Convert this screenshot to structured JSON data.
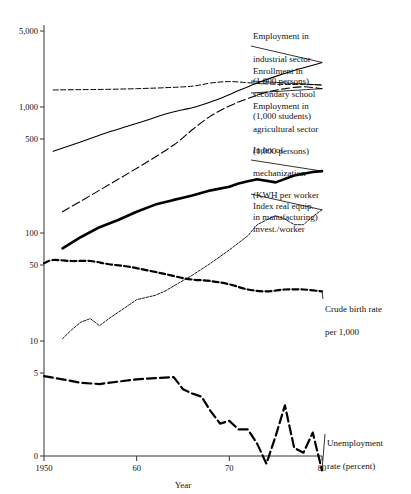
{
  "chart_data": {
    "type": "line",
    "title": "",
    "xlabel": "Year",
    "ylabel": "",
    "scale": "log",
    "grid": false,
    "legend_position": "right-inline-annotations",
    "xlim": [
      1950,
      1980
    ],
    "ylim": [
      0,
      5000
    ],
    "x_ticks": [
      {
        "value": 1950,
        "label": "1950"
      },
      {
        "value": 1960,
        "label": "60"
      },
      {
        "value": 1970,
        "label": "70"
      },
      {
        "value": 1980,
        "label": "80"
      }
    ],
    "y_ticks": [
      {
        "value": 5000,
        "label": "5,000"
      },
      {
        "value": 1000,
        "label": "1,000"
      },
      {
        "value": 500,
        "label": "500"
      },
      {
        "value": 100,
        "label": "100"
      },
      {
        "value": 50,
        "label": "50"
      },
      {
        "value": 10,
        "label": "10"
      },
      {
        "value": 5,
        "label": "5"
      },
      {
        "value": 0,
        "label": "0"
      }
    ],
    "series": [
      {
        "name": "Employment in industrial sector (1,000 persons)",
        "label_lines": [
          "Employment in",
          "industrial sector",
          "(1,000 persons)"
        ],
        "style": "solid-thin",
        "x": [
          1951,
          1953,
          1955,
          1957,
          1959,
          1961,
          1963,
          1965,
          1966,
          1967,
          1969,
          1971,
          1973,
          1975,
          1977,
          1979,
          1980
        ],
        "values": [
          440,
          500,
          570,
          650,
          730,
          820,
          930,
          1020,
          1060,
          1120,
          1280,
          1500,
          1750,
          2000,
          2250,
          2500,
          2650
        ]
      },
      {
        "name": "Enrollment in secondary school (1,000 students)",
        "label_lines": [
          "Enrollment in",
          "secondary school",
          "(1,000 students)"
        ],
        "style": "dashed-fine",
        "x": [
          1951,
          1954,
          1957,
          1960,
          1963,
          1966,
          1968,
          1970,
          1972,
          1974,
          1976,
          1978,
          1980
        ],
        "values": [
          1520,
          1530,
          1540,
          1560,
          1590,
          1640,
          1750,
          1800,
          1760,
          1720,
          1700,
          1700,
          1680
        ]
      },
      {
        "name": "Employment in agricultural sector (1,000 persons)",
        "label_lines": [
          "Employment in",
          "agricultural sector",
          "(1,000 persons)"
        ],
        "style": "long-dash",
        "x": [
          1952,
          1955,
          1958,
          1961,
          1964,
          1966,
          1968,
          1970,
          1972,
          1974,
          1976,
          1978,
          1980
        ],
        "values": [
          130,
          180,
          250,
          350,
          500,
          680,
          900,
          1100,
          1280,
          1450,
          1560,
          1620,
          1560
        ]
      },
      {
        "name": "Index of mechanization (KWH per worker in manufacturing)",
        "label_lines": [
          "Index of",
          "mechanization",
          "(KWH per worker",
          "in manufacturing)"
        ],
        "style": "solid-thick",
        "x": [
          1952,
          1954,
          1956,
          1958,
          1960,
          1962,
          1964,
          1965,
          1966,
          1968,
          1970,
          1971,
          1972,
          1973,
          1975,
          1977,
          1979,
          1980
        ],
        "values": [
          62,
          78,
          95,
          110,
          130,
          150,
          165,
          172,
          180,
          200,
          215,
          230,
          240,
          250,
          235,
          270,
          290,
          295
        ]
      },
      {
        "name": "Index real equip. invest./worker",
        "label_lines": [
          "Index real equip.",
          "invest./worker"
        ],
        "style": "dotted-fine",
        "x": [
          1952,
          1953,
          1954,
          1955,
          1956,
          1957,
          1958,
          1960,
          1962,
          1963,
          1964,
          1966,
          1968,
          1970,
          1972,
          1973,
          1974,
          1975,
          1976,
          1977,
          1978,
          1979,
          1980
        ],
        "values": [
          10,
          12,
          14,
          15,
          13,
          15,
          17,
          22,
          24,
          26,
          29,
          36,
          46,
          60,
          80,
          100,
          110,
          120,
          112,
          100,
          100,
          118,
          135
        ]
      },
      {
        "name": "Crude birth rate per 1,000",
        "label_lines": [
          "Crude birth rate",
          "per 1,000"
        ],
        "style": "dashed-bold",
        "x": [
          1950,
          1951,
          1953,
          1955,
          1957,
          1959,
          1961,
          1963,
          1965,
          1966,
          1968,
          1970,
          1972,
          1974,
          1976,
          1978,
          1980
        ],
        "values": [
          46,
          49,
          48,
          48,
          45,
          43,
          40,
          37,
          34,
          33,
          32,
          30,
          27,
          26,
          27,
          27,
          26
        ]
      },
      {
        "name": "Unemployment rate (percent)",
        "label_lines": [
          "Unemployment",
          "rate (percent)"
        ],
        "style": "dashed-long-bold",
        "x": [
          1950,
          1952,
          1954,
          1956,
          1958,
          1960,
          1962,
          1964,
          1965,
          1966,
          1967,
          1968,
          1969,
          1970,
          1971,
          1972,
          1973,
          1974,
          1975,
          1976,
          1977,
          1978,
          1979,
          1980
        ],
        "values": [
          4.7,
          4.4,
          4.1,
          4.0,
          4.2,
          4.4,
          4.5,
          4.6,
          3.6,
          3.3,
          3.1,
          2.3,
          1.8,
          1.9,
          1.6,
          1.6,
          1.2,
          0.8,
          1.4,
          2.6,
          1.1,
          1.0,
          1.5,
          0.7
        ]
      }
    ],
    "annotations": [
      "Employment in industrial sector (1,000 persons)",
      "Enrollment in secondary school (1,000 students)",
      "Employment in agricultural sector (1,000 persons)",
      "Index of mechanization (KWH per worker in manufacturing)",
      "Index real equip. invest./worker",
      "Crude birth rate per 1,000",
      "Unemployment rate (percent)"
    ]
  },
  "labels": {
    "s1_l1": "Employment in",
    "s1_l2": "industrial sector",
    "s1_l3": "(1,000 persons)",
    "s2_l1": "Enrollment in",
    "s2_l2": "secondary school",
    "s2_l3": "(1,000 students)",
    "s3_l1": "Employment in",
    "s3_l2": "agricultural sector",
    "s3_l3": "(1,000 persons)",
    "s4_l1": "Index of",
    "s4_l2": "mechanization",
    "s4_l3": "(KWH per worker",
    "s4_l4": "in manufacturing)",
    "s5_l1": "Index real equip.",
    "s5_l2": "invest./worker",
    "s6_l1": "Crude birth rate",
    "s6_l2": "per 1,000",
    "s7_l1": "Unemployment",
    "s7_l2": "rate (percent)"
  },
  "colors": {
    "ink": "#111111",
    "axis": "#333333",
    "background": "#ffffff"
  }
}
